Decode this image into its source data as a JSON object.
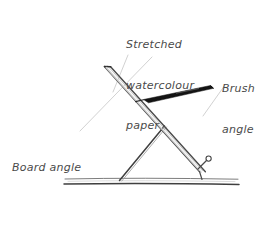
{
  "diagram": {
    "background_color": "#ffffff",
    "ink_color": "#3a3a3a",
    "leader_line_color": "#b9b9b9",
    "brush_color": "#141414",
    "labels": {
      "paper": {
        "name": "stretched-watercolour-paper",
        "line1": "Stretched",
        "line2": "watercolour",
        "line3": "paper"
      },
      "brush": {
        "name": "brush-angle",
        "line1": "Brush",
        "line2": "angle"
      },
      "board": {
        "name": "board-angle",
        "line1": "Board angle"
      },
      "table": {
        "name": "table-top",
        "line1": "Table top"
      }
    },
    "parts": [
      {
        "id": "drawing-board",
        "label": "Drawing board with stretched paper"
      },
      {
        "id": "support-strut",
        "label": "Support strut / prop"
      },
      {
        "id": "board-stop",
        "label": "Board stop catch"
      },
      {
        "id": "paint-brush",
        "label": "Paint brush"
      },
      {
        "id": "table-surface",
        "label": "Table surface"
      }
    ]
  }
}
